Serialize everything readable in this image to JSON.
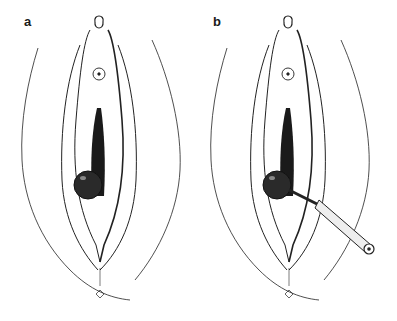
{
  "figure": {
    "panels": [
      {
        "label": "a",
        "description": "anatomical illustration with dark round cyst on left side"
      },
      {
        "label": "b",
        "description": "same illustration with needle/cannula instrument inserted into cyst"
      }
    ],
    "colors": {
      "line": "#222222",
      "fill_dark": "#1a1a1a",
      "background": "#ffffff"
    }
  }
}
